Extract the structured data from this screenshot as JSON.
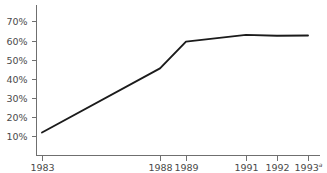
{
  "chart_data": {
    "type": "line",
    "title": "",
    "subtitle": "",
    "xlabel": "",
    "ylabel": "",
    "x": [
      1983,
      1988,
      1989,
      1991,
      1992,
      1993
    ],
    "values": [
      12,
      45.5,
      59.5,
      63,
      62.5,
      62.7
    ],
    "series": [
      {
        "name": "",
        "values": [
          12,
          45.5,
          59.5,
          63,
          62.5,
          62.7
        ],
        "color": "#1b1b1b"
      }
    ],
    "xtick_labels": [
      "1983",
      "1988",
      "1989",
      "1991",
      "1992",
      "1993"
    ],
    "xtick_superscripts": [
      "",
      "",
      "",
      "",
      "",
      "a"
    ],
    "xtick_positions_px": [
      42,
      160,
      186,
      246,
      277,
      308
    ],
    "ytick_labels": [
      "10%",
      "20%",
      "30%",
      "40%",
      "50%",
      "60%",
      "70%"
    ],
    "ytick_values": [
      10,
      20,
      30,
      40,
      50,
      60,
      70
    ],
    "ylim": [
      0,
      76
    ],
    "grid": false,
    "legend": "none",
    "annotations": [
      {
        "text": "a",
        "kind": "footnote-superscript",
        "attached_to": "1993"
      }
    ],
    "colors": {
      "line": "#1b1b1b",
      "axis": "#6f6f6f",
      "tick_label": "#4a4a4a",
      "background": "#ffffff"
    }
  }
}
